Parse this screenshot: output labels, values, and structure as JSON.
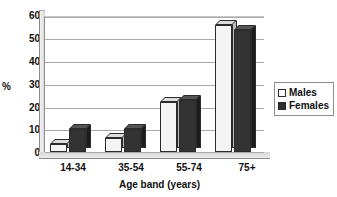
{
  "chart_data": {
    "type": "bar",
    "title": "",
    "xlabel": "Age band (years)",
    "ylabel": "%",
    "categories": [
      "14-34",
      "35-54",
      "55-74",
      "75+"
    ],
    "series": [
      {
        "name": "Males",
        "values": [
          3.5,
          6,
          22,
          56
        ]
      },
      {
        "name": "Females",
        "values": [
          10,
          10,
          23,
          54
        ]
      }
    ],
    "ylim": [
      0,
      60
    ],
    "yticks": [
      0,
      10,
      20,
      30,
      40,
      50,
      60
    ],
    "ytick_labels": [
      "0",
      "10",
      "20",
      "30",
      "40",
      "50",
      "60"
    ],
    "grid": true,
    "legend_position": "right",
    "colors": {
      "males": "#f4f4f4",
      "females": "#333333",
      "gridline": "#a9a9a9",
      "axis": "#8a8a8a",
      "text": "#101010"
    }
  },
  "legend": {
    "entries": [
      {
        "label": "Males"
      },
      {
        "label": "Females"
      }
    ]
  }
}
